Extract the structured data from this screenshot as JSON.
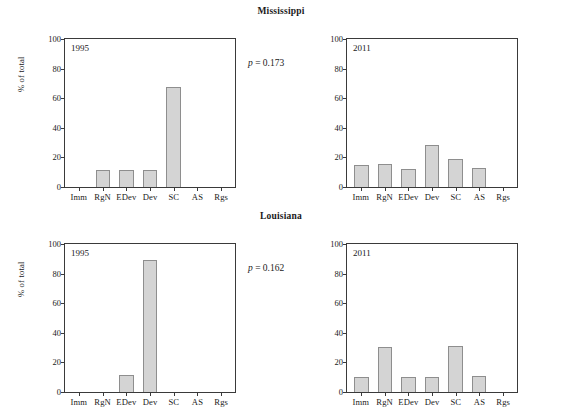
{
  "figure": {
    "ylabel": "% of total",
    "yticks": [
      "0",
      "20",
      "40",
      "60",
      "80",
      "100"
    ],
    "categories": [
      "Imm",
      "RgN",
      "EDev",
      "Dev",
      "SC",
      "AS",
      "Rgs"
    ]
  },
  "rows": [
    {
      "state": "Mississippi",
      "pvalue_symbol": "p",
      "pvalue_text": " = 0.173",
      "panels": [
        {
          "year": "1995",
          "values": [
            0,
            11.5,
            11.5,
            11.8,
            67.5,
            0,
            0
          ]
        },
        {
          "year": "2011",
          "values": [
            15.2,
            15.4,
            12.5,
            28.2,
            18.8,
            12.8,
            0
          ]
        }
      ]
    },
    {
      "state": "Louisiana",
      "pvalue_symbol": "p",
      "pvalue_text": " = 0.162",
      "panels": [
        {
          "year": "1995",
          "values": [
            0,
            0,
            11.7,
            89.5,
            0,
            0,
            0
          ]
        },
        {
          "year": "2011",
          "values": [
            9.9,
            30.2,
            10.0,
            10.3,
            30.8,
            10.5,
            0
          ]
        }
      ]
    }
  ],
  "chart_data": {
    "type": "bar",
    "title": "",
    "xlabel": "",
    "ylabel": "% of total",
    "ylim": [
      0,
      100
    ],
    "yticks": [
      0,
      20,
      40,
      60,
      80,
      100
    ],
    "grid": false,
    "legend": "none",
    "categories": [
      "Imm",
      "RgN",
      "EDev",
      "Dev",
      "SC",
      "AS",
      "Rgs"
    ],
    "panels": [
      {
        "panel_title": "Mississippi",
        "subpanel": "1995",
        "annotation": "p = 0.173",
        "values": [
          0,
          11.5,
          11.5,
          11.8,
          67.5,
          0,
          0
        ]
      },
      {
        "panel_title": "Mississippi",
        "subpanel": "2011",
        "annotation": "p = 0.173",
        "values": [
          15.2,
          15.4,
          12.5,
          28.2,
          18.8,
          12.8,
          0
        ]
      },
      {
        "panel_title": "Louisiana",
        "subpanel": "1995",
        "annotation": "p = 0.162",
        "values": [
          0,
          0,
          11.7,
          89.5,
          0,
          0,
          0
        ]
      },
      {
        "panel_title": "Louisiana",
        "subpanel": "2011",
        "annotation": "p = 0.162",
        "values": [
          9.9,
          30.2,
          10.0,
          10.3,
          30.8,
          10.5,
          0
        ]
      }
    ],
    "bar_color": "#d4d4d4",
    "bar_edge_color": "#8e8e8e"
  }
}
